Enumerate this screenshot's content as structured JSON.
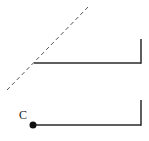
{
  "diagram": {
    "colors": {
      "line": "#2a2a2a",
      "dashed": "#555555",
      "background": "#ffffff"
    },
    "upper_figure": {
      "has_dashed_diagonal": true
    },
    "lower_figure": {
      "point_label": "C"
    }
  }
}
